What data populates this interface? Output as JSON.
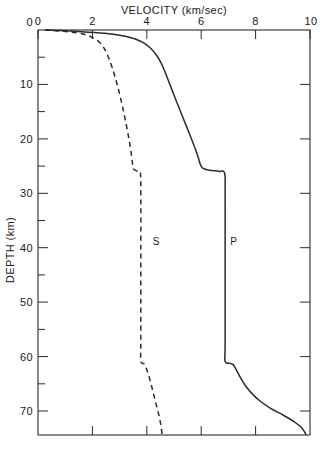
{
  "chart_data": {
    "type": "line",
    "title": "VELOCITY  (km/sec)",
    "xlabel": "VELOCITY  (km/sec)",
    "ylabel": "DEPTH  (km)",
    "xlim": [
      0,
      10
    ],
    "ylim": [
      74.5,
      0
    ],
    "y_inverted": true,
    "grid": false,
    "legend": "inline-curve-labels",
    "x_ticks": [
      {
        "value": 0,
        "label": "0"
      },
      {
        "value": 2,
        "label": "2"
      },
      {
        "value": 4,
        "label": "4"
      },
      {
        "value": 6,
        "label": "6"
      },
      {
        "value": 8,
        "label": "8"
      },
      {
        "value": 10,
        "label": "10"
      }
    ],
    "y_ticks": [
      {
        "value": 0,
        "label": "0"
      },
      {
        "value": 5,
        "label": ""
      },
      {
        "value": 10,
        "label": "10"
      },
      {
        "value": 15,
        "label": ""
      },
      {
        "value": 20,
        "label": "20"
      },
      {
        "value": 25,
        "label": ""
      },
      {
        "value": 30,
        "label": "30"
      },
      {
        "value": 35,
        "label": ""
      },
      {
        "value": 40,
        "label": "40"
      },
      {
        "value": 45,
        "label": ""
      },
      {
        "value": 50,
        "label": "50"
      },
      {
        "value": 55,
        "label": ""
      },
      {
        "value": 60,
        "label": "60"
      },
      {
        "value": 65,
        "label": ""
      },
      {
        "value": 70,
        "label": "70"
      }
    ],
    "series": [
      {
        "name": "P",
        "label": "P",
        "style": "solid",
        "label_at": {
          "velocity": 7.2,
          "depth": 39
        },
        "points": [
          {
            "v": 0.3,
            "d": 0.0
          },
          {
            "v": 1.6,
            "d": 0.3
          },
          {
            "v": 2.45,
            "d": 0.6
          },
          {
            "v": 3.05,
            "d": 1.0
          },
          {
            "v": 3.55,
            "d": 1.6
          },
          {
            "v": 3.9,
            "d": 2.4
          },
          {
            "v": 4.15,
            "d": 3.4
          },
          {
            "v": 4.35,
            "d": 4.6
          },
          {
            "v": 4.52,
            "d": 6.0
          },
          {
            "v": 4.66,
            "d": 7.6
          },
          {
            "v": 4.8,
            "d": 9.4
          },
          {
            "v": 4.94,
            "d": 11.2
          },
          {
            "v": 5.08,
            "d": 13.0
          },
          {
            "v": 5.24,
            "d": 15.0
          },
          {
            "v": 5.4,
            "d": 17.0
          },
          {
            "v": 5.56,
            "d": 19.0
          },
          {
            "v": 5.7,
            "d": 20.8
          },
          {
            "v": 5.82,
            "d": 22.4
          },
          {
            "v": 5.9,
            "d": 23.6
          },
          {
            "v": 5.96,
            "d": 24.6
          },
          {
            "v": 6.05,
            "d": 25.4
          },
          {
            "v": 6.3,
            "d": 25.8
          },
          {
            "v": 6.65,
            "d": 26.0
          },
          {
            "v": 6.86,
            "d": 26.3
          },
          {
            "v": 6.88,
            "d": 30.0
          },
          {
            "v": 6.88,
            "d": 40.0
          },
          {
            "v": 6.88,
            "d": 50.0
          },
          {
            "v": 6.88,
            "d": 58.0
          },
          {
            "v": 6.88,
            "d": 61.0
          },
          {
            "v": 7.05,
            "d": 61.3
          },
          {
            "v": 7.18,
            "d": 61.6
          },
          {
            "v": 7.3,
            "d": 62.6
          },
          {
            "v": 7.45,
            "d": 64.0
          },
          {
            "v": 7.62,
            "d": 65.4
          },
          {
            "v": 7.85,
            "d": 66.8
          },
          {
            "v": 8.15,
            "d": 68.2
          },
          {
            "v": 8.55,
            "d": 69.6
          },
          {
            "v": 9.0,
            "d": 70.8
          },
          {
            "v": 9.4,
            "d": 72.0
          },
          {
            "v": 9.7,
            "d": 73.2
          },
          {
            "v": 9.85,
            "d": 74.4
          }
        ],
        "discontinuities": [
          {
            "depth": 26.0,
            "from": 6.05,
            "to": 6.86
          },
          {
            "depth": 61.0,
            "from": 6.88,
            "to": 7.18
          }
        ]
      },
      {
        "name": "S",
        "label": "S",
        "style": "dashed",
        "label_at": {
          "velocity": 4.35,
          "depth": 39
        },
        "points": [
          {
            "v": 0.25,
            "d": 0.0
          },
          {
            "v": 0.95,
            "d": 0.25
          },
          {
            "v": 1.45,
            "d": 0.55
          },
          {
            "v": 1.8,
            "d": 0.95
          },
          {
            "v": 2.05,
            "d": 1.5
          },
          {
            "v": 2.25,
            "d": 2.2
          },
          {
            "v": 2.4,
            "d": 3.1
          },
          {
            "v": 2.52,
            "d": 4.2
          },
          {
            "v": 2.62,
            "d": 5.4
          },
          {
            "v": 2.72,
            "d": 6.8
          },
          {
            "v": 2.82,
            "d": 8.4
          },
          {
            "v": 2.92,
            "d": 10.2
          },
          {
            "v": 3.02,
            "d": 12.2
          },
          {
            "v": 3.12,
            "d": 14.4
          },
          {
            "v": 3.22,
            "d": 16.8
          },
          {
            "v": 3.32,
            "d": 19.4
          },
          {
            "v": 3.4,
            "d": 21.8
          },
          {
            "v": 3.45,
            "d": 23.6
          },
          {
            "v": 3.48,
            "d": 24.8
          },
          {
            "v": 3.5,
            "d": 25.5
          },
          {
            "v": 3.62,
            "d": 25.9
          },
          {
            "v": 3.76,
            "d": 26.2
          },
          {
            "v": 3.78,
            "d": 30.0
          },
          {
            "v": 3.78,
            "d": 40.0
          },
          {
            "v": 3.78,
            "d": 50.0
          },
          {
            "v": 3.78,
            "d": 58.0
          },
          {
            "v": 3.78,
            "d": 61.0
          },
          {
            "v": 3.9,
            "d": 61.4
          },
          {
            "v": 3.98,
            "d": 62.2
          },
          {
            "v": 4.06,
            "d": 63.4
          },
          {
            "v": 4.14,
            "d": 64.8
          },
          {
            "v": 4.22,
            "d": 66.4
          },
          {
            "v": 4.3,
            "d": 68.0
          },
          {
            "v": 4.38,
            "d": 69.6
          },
          {
            "v": 4.46,
            "d": 71.2
          },
          {
            "v": 4.52,
            "d": 72.8
          },
          {
            "v": 4.56,
            "d": 74.4
          }
        ],
        "discontinuities": [
          {
            "depth": 26.0,
            "from": 3.5,
            "to": 3.76
          },
          {
            "depth": 61.0,
            "from": 3.78,
            "to": 3.98
          }
        ]
      }
    ]
  },
  "axes": {
    "title": "VELOCITY  (km/sec)",
    "y_axis_title": "DEPTH  (km)",
    "x_tick_labels": [
      "0",
      "2",
      "4",
      "6",
      "8",
      "10"
    ],
    "y_tick_labels": [
      "0",
      "10",
      "20",
      "30",
      "40",
      "50",
      "60",
      "70"
    ]
  },
  "labels": {
    "s_curve": "S",
    "p_curve": "P"
  },
  "colors": {
    "ink": "#2b2b2b",
    "background": "#ffffff"
  }
}
